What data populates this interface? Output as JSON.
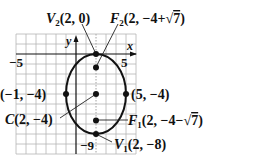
{
  "figure": {
    "type": "ellipse-graph",
    "axes": {
      "x_label": "x",
      "y_label": "y",
      "x_tick_labels": [
        {
          "value": -5,
          "text": "−5"
        },
        {
          "value": 5,
          "text": "5"
        }
      ],
      "y_tick_labels": [
        {
          "value": -9,
          "text": "−9"
        }
      ],
      "grid_x_range": [
        -6,
        6
      ],
      "grid_y_range": [
        -10,
        2
      ]
    },
    "ellipse": {
      "center": [
        2,
        -4
      ],
      "a": 4,
      "b": 3,
      "orientation": "vertical"
    },
    "points": {
      "V2": {
        "name": "V",
        "sub": "2",
        "coords": "(2, 0)",
        "x": 2,
        "y": 0
      },
      "F2": {
        "name": "F",
        "sub": "2",
        "coords_prefix": "(2, −4+",
        "sqrt": "7",
        "coords_suffix": ")",
        "x": 2,
        "y": -1.354
      },
      "left": {
        "coords": "(−1, −4)",
        "x": -1,
        "y": -4
      },
      "right": {
        "coords": "(5, −4)",
        "x": 5,
        "y": -4
      },
      "C": {
        "name": "C",
        "coords": "(2, −4)",
        "x": 2,
        "y": -4
      },
      "F1": {
        "name": "F",
        "sub": "1",
        "coords_prefix": "(2, −4−",
        "sqrt": "7",
        "coords_suffix": ")",
        "x": 2,
        "y": -6.646
      },
      "V1": {
        "name": "V",
        "sub": "1",
        "coords": "(2, −8)",
        "x": 2,
        "y": -8
      }
    },
    "colors": {
      "ink": "#111111",
      "grid_major": "#9a9a9a",
      "grid_minor": "#c8c8c8"
    }
  }
}
